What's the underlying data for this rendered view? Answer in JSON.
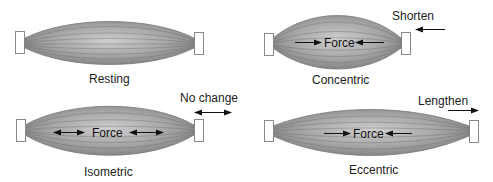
{
  "diagram": {
    "panels": [
      {
        "id": "resting",
        "label": "Resting",
        "force_label": "",
        "motion_label": "",
        "force_arrows": "none",
        "motion_arrow": "none"
      },
      {
        "id": "concentric",
        "label": "Concentric",
        "force_label": "Force",
        "motion_label": "Shorten",
        "force_arrows": "inward",
        "motion_arrow": "left"
      },
      {
        "id": "isometric",
        "label": "Isometric",
        "force_label": "Force",
        "motion_label": "No change",
        "force_arrows": "double-headed",
        "motion_arrow": "double-headed"
      },
      {
        "id": "eccentric",
        "label": "Eccentric",
        "force_label": "Force",
        "motion_label": "Lengthen",
        "force_arrows": "inward",
        "motion_arrow": "right"
      }
    ],
    "colors": {
      "muscle_fill": "#9a9a9a",
      "muscle_highlight": "#c8c8c8",
      "fiber_line": "#6e6e6e",
      "tendon_box_stroke": "#888888",
      "arrow": "#111111",
      "text": "#222222"
    }
  }
}
